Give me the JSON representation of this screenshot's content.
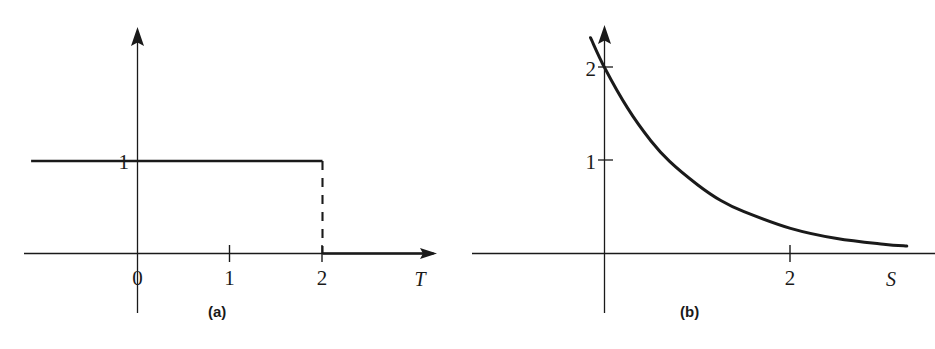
{
  "figure": {
    "background_color": "#ffffff",
    "ink_color": "#1a1a1a",
    "panels": [
      {
        "id": "a",
        "caption": "(a)",
        "xlabel": "T",
        "x_ticks": [
          "0",
          "1",
          "2"
        ],
        "y_ticks": [
          "1"
        ]
      },
      {
        "id": "b",
        "caption": "(b)",
        "xlabel": "S",
        "x_ticks": [
          "2"
        ],
        "y_ticks": [
          "1",
          "2"
        ]
      }
    ]
  },
  "chart_data": [
    {
      "type": "line",
      "title": "(a)",
      "xlabel": "T",
      "ylabel": "",
      "xlim": [
        -1.15,
        3.2
      ],
      "ylim": [
        -0.45,
        2.45
      ],
      "grid": false,
      "legend": null,
      "xticks": [
        0,
        1,
        2
      ],
      "xticklabels": [
        "0",
        "1",
        "2"
      ],
      "yticks": [
        1
      ],
      "yticklabels": [
        "1"
      ],
      "description": "Rectangular pulse: value 1 for T less than 2, value 0 for T greater than 2, with a dashed vertical drop at T = 2.",
      "series": [
        {
          "name": "pulse-level",
          "style": "solid",
          "x": [
            -1.15,
            2.0
          ],
          "y": [
            1,
            1
          ]
        },
        {
          "name": "pulse-drop",
          "style": "dashed",
          "x": [
            2.0,
            2.0
          ],
          "y": [
            1,
            0
          ]
        },
        {
          "name": "pulse-zero-tail",
          "style": "solid",
          "x": [
            2.0,
            3.2
          ],
          "y": [
            0,
            0
          ]
        }
      ]
    },
    {
      "type": "line",
      "title": "(b)",
      "xlabel": "S",
      "ylabel": "",
      "xlim": [
        -0.6,
        3.3
      ],
      "ylim": [
        -0.45,
        2.55
      ],
      "grid": false,
      "legend": null,
      "xticks": [
        2
      ],
      "xticklabels": [
        "2"
      ],
      "yticks": [
        1,
        2
      ],
      "yticklabels": [
        "1",
        "2"
      ],
      "description": "Decaying exponential curve starting above 2 at negative S, passing through 2 at S = 0, through 1 near S = 0.7, and approaching 0 asymptotically as S increases.",
      "series": [
        {
          "name": "exponential-decay",
          "style": "solid",
          "formula": "y = 2 * exp(-S)",
          "x": [
            -0.15,
            0.0,
            0.25,
            0.5,
            0.7,
            1.0,
            1.25,
            1.5,
            2.0,
            2.5,
            3.0,
            3.25
          ],
          "y": [
            2.32,
            2.0,
            1.56,
            1.21,
            0.99,
            0.74,
            0.57,
            0.45,
            0.27,
            0.16,
            0.1,
            0.08
          ]
        }
      ]
    }
  ]
}
